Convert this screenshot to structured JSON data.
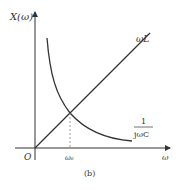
{
  "figure": {
    "caption": "(b)",
    "y_axis_label": "X(ω)",
    "x_axis_label": "ω",
    "origin_label": "O",
    "resonance_label": "ω₀",
    "curves": {
      "inductive": {
        "label": "ωL"
      },
      "capacitive": {
        "label_numerator": "1",
        "label_denominator": "jωC"
      }
    },
    "colors": {
      "stroke": "#333333",
      "dashed": "#888888",
      "background": "#ffffff"
    }
  }
}
